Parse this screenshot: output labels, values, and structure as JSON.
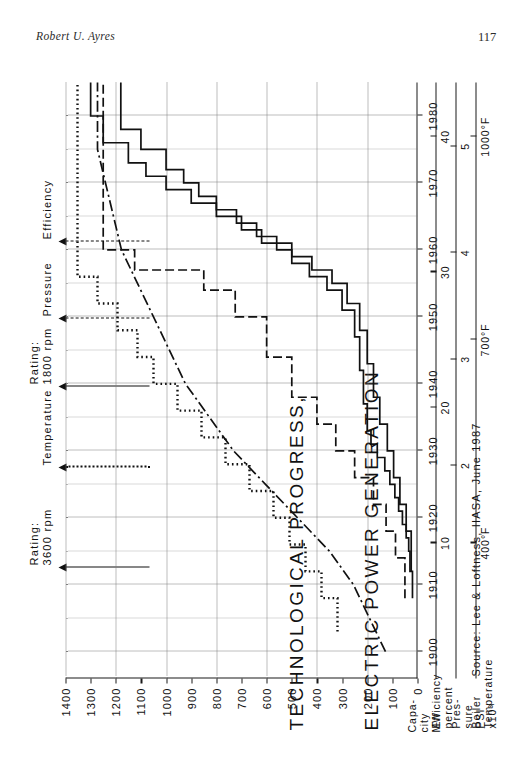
{
  "page": {
    "running_head": "Robert U. Ayres",
    "number": "117"
  },
  "figure": {
    "title_line1": "TECHNOLOGICAL PROGRESS,",
    "title_line2": "ELECTRIC POWER GENERATION",
    "source": "Source: Lee & Loftness, IIASA, June 1987"
  },
  "legend": [
    {
      "label": "Rating:\n3600 rpm",
      "style": "solid"
    },
    {
      "label": "Temperature",
      "style": "dotted"
    },
    {
      "label": "Rating:\n1800 rpm",
      "style": "solid"
    },
    {
      "label": "Pressure",
      "style": "dashed"
    },
    {
      "label": "Efficiency",
      "style": "dashdot"
    }
  ],
  "axes": {
    "x": {
      "title": "",
      "ticks": [
        "1900",
        "1910",
        "1920",
        "1930",
        "1940",
        "1950",
        "1960",
        "1970",
        "1980"
      ],
      "min": 1896,
      "max": 1985
    },
    "capacity": {
      "title_line1": "Capa-",
      "title_line2": "city",
      "title_line3": "MW",
      "ticks": [
        "0",
        "100",
        "200",
        "300",
        "400",
        "500",
        "600",
        "700",
        "800",
        "900",
        "1000",
        "1100",
        "1200",
        "1300",
        "1400"
      ],
      "min": 0,
      "max": 1400
    },
    "efficiency": {
      "title_line1": "Efficiency",
      "title_line2": "percent",
      "ticks": [
        "10",
        "20",
        "30",
        "40"
      ],
      "min": 0,
      "max": 44
    },
    "pressure": {
      "title_line1": "Pres-",
      "title_line2": "sure",
      "title_line3": "PSI",
      "title_line4": "x10³",
      "ticks": [
        "2",
        "3",
        "4",
        "5"
      ],
      "min": 0,
      "max": 5.6
    },
    "temperature": {
      "title_line1": "Boiler",
      "title_line2": "Temperature",
      "ticks": [
        "400°F",
        "700°F",
        "1000°F"
      ],
      "min": 200,
      "max": 1080
    }
  },
  "chart_data": {
    "type": "line",
    "title": "TECHNOLOGICAL PROGRESS, ELECTRIC POWER GENERATION",
    "xlabel": "",
    "ylabel": "Capacity MW / Efficiency percent / Pressure PSI x10³ / Boiler Temperature °F",
    "xlim": [
      1896,
      1985
    ],
    "grid": true,
    "legend_position": "top",
    "series": [
      {
        "name": "Rating: 3600 rpm",
        "style": "solid",
        "unit": "MW",
        "axis": "capacity",
        "step": true,
        "points": [
          [
            1908,
            20
          ],
          [
            1912,
            30
          ],
          [
            1915,
            35
          ],
          [
            1917,
            45
          ],
          [
            1919,
            60
          ],
          [
            1921,
            75
          ],
          [
            1923,
            90
          ],
          [
            1925,
            110
          ],
          [
            1927,
            130
          ],
          [
            1929,
            160
          ],
          [
            1931,
            185
          ],
          [
            1933,
            200
          ],
          [
            1937,
            215
          ],
          [
            1942,
            230
          ],
          [
            1947,
            250
          ],
          [
            1951,
            300
          ],
          [
            1954,
            360
          ],
          [
            1956,
            430
          ],
          [
            1958,
            500
          ],
          [
            1960,
            560
          ],
          [
            1962,
            640
          ],
          [
            1964,
            720
          ],
          [
            1966,
            800
          ],
          [
            1968,
            870
          ],
          [
            1970,
            930
          ],
          [
            1972,
            1000
          ],
          [
            1975,
            1100
          ],
          [
            1978,
            1180
          ],
          [
            1985,
            1180
          ]
        ]
      },
      {
        "name": "Rating: 1800 rpm",
        "style": "solid",
        "unit": "MW",
        "axis": "capacity",
        "step": true,
        "points": [
          [
            1912,
            25
          ],
          [
            1918,
            45
          ],
          [
            1922,
            70
          ],
          [
            1926,
            95
          ],
          [
            1930,
            120
          ],
          [
            1934,
            150
          ],
          [
            1938,
            175
          ],
          [
            1943,
            200
          ],
          [
            1948,
            230
          ],
          [
            1952,
            280
          ],
          [
            1955,
            340
          ],
          [
            1957,
            420
          ],
          [
            1959,
            500
          ],
          [
            1961,
            620
          ],
          [
            1963,
            700
          ],
          [
            1965,
            800
          ],
          [
            1967,
            900
          ],
          [
            1969,
            1000
          ],
          [
            1971,
            1080
          ],
          [
            1973,
            1150
          ],
          [
            1976,
            1250
          ],
          [
            1980,
            1300
          ],
          [
            1985,
            1300
          ]
        ]
      },
      {
        "name": "Temperature",
        "style": "dotted",
        "unit": "°F",
        "axis": "temperature",
        "step": true,
        "points": [
          [
            1903,
            400
          ],
          [
            1908,
            440
          ],
          [
            1912,
            480
          ],
          [
            1916,
            520
          ],
          [
            1920,
            560
          ],
          [
            1924,
            620
          ],
          [
            1928,
            680
          ],
          [
            1932,
            740
          ],
          [
            1936,
            800
          ],
          [
            1940,
            860
          ],
          [
            1944,
            900
          ],
          [
            1948,
            950
          ],
          [
            1952,
            1000
          ],
          [
            1956,
            1050
          ],
          [
            1960,
            1050
          ],
          [
            1985,
            1050
          ]
        ]
      },
      {
        "name": "Pressure",
        "style": "dashed",
        "unit": "PSI x10³",
        "axis": "pressure",
        "step": true,
        "points": [
          [
            1908,
            0.2
          ],
          [
            1914,
            0.35
          ],
          [
            1918,
            0.5
          ],
          [
            1922,
            0.7
          ],
          [
            1926,
            1.0
          ],
          [
            1930,
            1.3
          ],
          [
            1934,
            1.6
          ],
          [
            1938,
            2.0
          ],
          [
            1944,
            2.4
          ],
          [
            1950,
            2.9
          ],
          [
            1954,
            3.4
          ],
          [
            1957,
            4.5
          ],
          [
            1960,
            5.0
          ],
          [
            1985,
            5.0
          ]
        ]
      },
      {
        "name": "Efficiency",
        "style": "dashdot",
        "unit": "percent",
        "axis": "efficiency",
        "step": false,
        "points": [
          [
            1900,
            4
          ],
          [
            1905,
            6
          ],
          [
            1910,
            8
          ],
          [
            1915,
            11
          ],
          [
            1920,
            15
          ],
          [
            1925,
            19
          ],
          [
            1930,
            23
          ],
          [
            1935,
            26
          ],
          [
            1940,
            29
          ],
          [
            1945,
            31
          ],
          [
            1950,
            33
          ],
          [
            1955,
            35
          ],
          [
            1960,
            37
          ],
          [
            1965,
            38
          ],
          [
            1970,
            39
          ],
          [
            1975,
            40
          ],
          [
            1980,
            40
          ],
          [
            1985,
            40
          ]
        ]
      }
    ]
  }
}
